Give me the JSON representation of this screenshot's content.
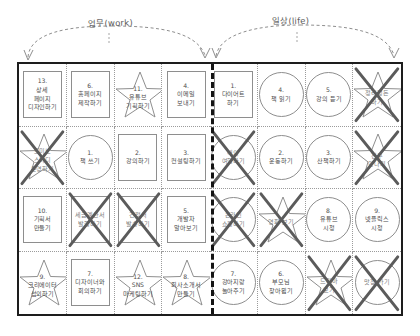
{
  "annotations": {
    "work_label": "업무(work)",
    "life_label": "일상(life)"
  },
  "board": {
    "columns": 8,
    "rows": 4,
    "divider_after_column": 4,
    "cells": [
      {
        "shape": "square",
        "number": "13.",
        "text": "13.\n상세\n페이지\n디자인하기",
        "done": false,
        "side": "work"
      },
      {
        "shape": "square",
        "number": "6.",
        "text": "6.\n홈페이지\n제작하기",
        "done": false,
        "side": "work"
      },
      {
        "shape": "star",
        "number": "11.",
        "text": "11.\n유튜브\n기획하기",
        "done": false,
        "side": "work"
      },
      {
        "shape": "square",
        "number": "4.",
        "text": "4.\n이메일\n보내기",
        "done": false,
        "side": "work"
      },
      {
        "shape": "square",
        "number": "1.",
        "text": "1.\n다이어트\n하기",
        "done": false,
        "side": "life"
      },
      {
        "shape": "circle",
        "number": "4.",
        "text": "4.\n책 읽기",
        "done": false,
        "side": "life"
      },
      {
        "shape": "circle",
        "number": "5.",
        "text": "5.\n강의 듣기",
        "done": false,
        "side": "life"
      },
      {
        "shape": "star",
        "number": "",
        "text": "정리정돈\n하기",
        "done": true,
        "side": "life"
      },
      {
        "shape": "star",
        "number": "",
        "text": "도미노\n스터디\n운영하기",
        "done": true,
        "side": "work"
      },
      {
        "shape": "circle",
        "number": "1.",
        "text": "1.\n책 쓰기",
        "done": false,
        "side": "work"
      },
      {
        "shape": "square",
        "number": "2.",
        "text": "2.\n강의하기",
        "done": false,
        "side": "work"
      },
      {
        "shape": "square",
        "number": "3.",
        "text": "3.\n컨설팅하기",
        "done": false,
        "side": "work"
      },
      {
        "shape": "circle",
        "number": "",
        "text": "해외\n여행하기",
        "done": true,
        "side": "life"
      },
      {
        "shape": "circle",
        "number": "2.",
        "text": "2.\n운동하기",
        "done": false,
        "side": "life"
      },
      {
        "shape": "circle",
        "number": "3.",
        "text": "3.\n산책하기",
        "done": false,
        "side": "life"
      },
      {
        "shape": "star",
        "number": "",
        "text": "친구\n만나기",
        "done": true,
        "side": "life"
      },
      {
        "shape": "square",
        "number": "10.",
        "text": "10.\n기획서\n만들기",
        "done": false,
        "side": "work"
      },
      {
        "shape": "square",
        "number": "",
        "text": "세금계산서\n발행하기",
        "done": true,
        "side": "work"
      },
      {
        "shape": "square",
        "number": "",
        "text": "견적서\n발송하기",
        "done": true,
        "side": "work"
      },
      {
        "shape": "square",
        "number": "5.",
        "text": "5.\n개발자\n알아보기",
        "done": false,
        "side": "work"
      },
      {
        "shape": "circle",
        "number": "",
        "text": "온라인\n쇼핑하기",
        "done": true,
        "side": "life"
      },
      {
        "shape": "star",
        "number": "",
        "text": "영화 보기",
        "done": true,
        "side": "life"
      },
      {
        "shape": "circle",
        "number": "8.",
        "text": "8.\n유튜브\n시청",
        "done": false,
        "side": "life"
      },
      {
        "shape": "circle",
        "number": "9.",
        "text": "9.\n넷플릭스\n시청",
        "done": false,
        "side": "life"
      },
      {
        "shape": "star",
        "number": "9.",
        "text": "9.\n크리에이터\n섭외하기",
        "done": false,
        "side": "work"
      },
      {
        "shape": "square",
        "number": "7.",
        "text": "7.\n디자이너와\n회의하기",
        "done": false,
        "side": "work"
      },
      {
        "shape": "star",
        "number": "12.",
        "text": "12.\nSNS\n마케팅하기",
        "done": false,
        "side": "work"
      },
      {
        "shape": "star",
        "number": "8.",
        "text": "8.\n회사소개서\n만들기",
        "done": false,
        "side": "work"
      },
      {
        "shape": "circle",
        "number": "7.",
        "text": "7.\n강아지랑\n놀아주기",
        "done": false,
        "side": "life"
      },
      {
        "shape": "circle",
        "number": "6.",
        "text": "6.\n부모님\n찾아뵙기",
        "done": false,
        "side": "life"
      },
      {
        "shape": "star",
        "number": "",
        "text": "드라마\n보기",
        "done": true,
        "side": "life"
      },
      {
        "shape": "circle",
        "number": "",
        "text": "맛집 가기",
        "done": true,
        "side": "life"
      }
    ]
  },
  "colors": {
    "board_border": "#1d1d1d",
    "cell_border": "#9b9b9b",
    "shape_border": "#8e8e8e",
    "text": "#4c4c4c",
    "strike": "#5b5b5b",
    "divider": "#141414"
  }
}
